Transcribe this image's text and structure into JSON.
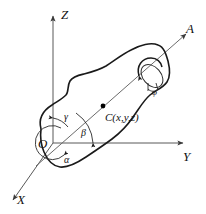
{
  "figure": {
    "type": "3d-coordinate-diagram",
    "background_color": "#ffffff",
    "outline_color": "#1a1a1a",
    "axis_color": "#585858"
  },
  "axes": {
    "z": {
      "label": "Z",
      "direction": "up"
    },
    "y": {
      "label": "Y",
      "direction": "right"
    },
    "x": {
      "label": "X",
      "direction": "down-left"
    },
    "a": {
      "label": "A",
      "direction": "up-right",
      "note": "rotation axis"
    }
  },
  "origin": {
    "label": "O"
  },
  "angles": [
    {
      "name": "gamma",
      "label": "γ",
      "measured_from": "Z"
    },
    {
      "name": "beta",
      "label": "β",
      "measured_from": "Y"
    },
    {
      "name": "alpha",
      "label": "α",
      "measured_from": "X"
    },
    {
      "name": "phi",
      "label": "φ",
      "measured_from": "A",
      "note": "rotation angle about axis A"
    }
  ],
  "center_point": {
    "label": "C(x,y,z)",
    "marker": "filled-dot"
  }
}
